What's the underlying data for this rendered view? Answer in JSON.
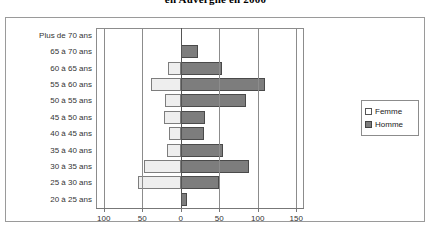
{
  "title": "en Auvergne en 2000",
  "legend": {
    "position": "right",
    "items": [
      {
        "label": "Femme",
        "swatch": "light"
      },
      {
        "label": "Homme",
        "swatch": "dark"
      }
    ]
  },
  "axis": {
    "ticks": [
      "100",
      "50",
      "0",
      "50",
      "100",
      "150"
    ],
    "tick_values": [
      -100,
      -50,
      0,
      50,
      100,
      150
    ]
  },
  "chart_data": {
    "type": "bar",
    "orientation": "horizontal",
    "subtype": "population-pyramid",
    "title": "en Auvergne en 2000",
    "xlabel": "",
    "ylabel": "",
    "xlim": [
      -110,
      160
    ],
    "grid": true,
    "legend_position": "right",
    "categories": [
      "Plus de 70 ans",
      "65 à 70 ans",
      "60 à 65 ans",
      "55 à 60 ans",
      "50 à 55 ans",
      "45 à 50 ans",
      "40 à 45 ans",
      "35 à 40 ans",
      "30 à 35 ans",
      "25 à 30 ans",
      "20 à 25 ans"
    ],
    "series": [
      {
        "name": "Femme",
        "color": "#eeeeee",
        "values": [
          0,
          0,
          16,
          38,
          20,
          22,
          15,
          18,
          48,
          55,
          0
        ]
      },
      {
        "name": "Homme",
        "color": "#7d7d7d",
        "values": [
          0,
          22,
          54,
          110,
          85,
          32,
          30,
          55,
          88,
          50,
          8
        ]
      }
    ]
  }
}
